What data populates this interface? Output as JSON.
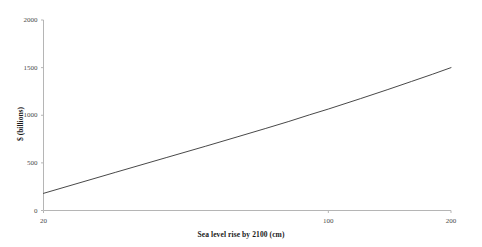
{
  "chart_data": {
    "type": "line",
    "title": "",
    "xlabel": "Sea level rise by 2100 (cm)",
    "ylabel": "$ (billions)",
    "xscale": "log",
    "yscale": "linear",
    "xlim": [
      20,
      200
    ],
    "ylim": [
      0,
      2000
    ],
    "xticks": [
      20,
      100,
      200
    ],
    "xtick_labels": [
      "20",
      "100",
      "200"
    ],
    "yticks": [
      0,
      500,
      1000,
      1500,
      2000
    ],
    "ytick_labels": [
      "0",
      "500",
      "1000",
      "1500",
      "2000"
    ],
    "grid": false,
    "legend": null,
    "series": [
      {
        "name": "Damage cost",
        "color": "#333333",
        "x": [
          20,
          30,
          40,
          50,
          60,
          70,
          80,
          90,
          100,
          120,
          140,
          160,
          180,
          200
        ],
        "values": [
          180,
          400,
          555,
          675,
          775,
          860,
          935,
          1005,
          1065,
          1175,
          1270,
          1355,
          1430,
          1500
        ]
      }
    ]
  },
  "axes": {
    "x_title": "Sea level rise by 2100 (cm)",
    "y_title": "$ (billions)"
  },
  "ticks": {
    "y": [
      {
        "label": "2000",
        "value": 2000
      },
      {
        "label": "1500",
        "value": 1500
      },
      {
        "label": "1000",
        "value": 1000
      },
      {
        "label": "500",
        "value": 500
      },
      {
        "label": "0",
        "value": 0
      }
    ],
    "x": [
      {
        "label": "20",
        "value": 20
      },
      {
        "label": "100",
        "value": 100
      },
      {
        "label": "200",
        "value": 200
      }
    ]
  }
}
